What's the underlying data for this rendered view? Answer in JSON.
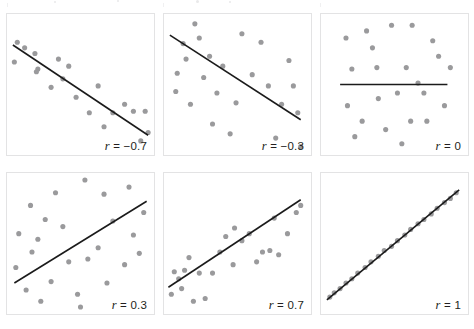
{
  "figure": {
    "width": 474,
    "height": 329,
    "background": "#ffffff",
    "dot_color": "#9a9a9c",
    "line_color": "#1b1b1b",
    "border_color": "#e3e3e4",
    "label_color": "#231f20"
  },
  "panels": [
    {
      "id": "panel-r-minus-0-7",
      "label_r": "r",
      "label_eq": " = −0.7",
      "label_full": "r = −0.7",
      "r_value": -0.7,
      "rect": {
        "x": 6,
        "y": 13,
        "w": 149,
        "h": 143
      },
      "chart_data": {
        "type": "scatter",
        "title": "r = −0.7",
        "xlabel": "",
        "ylabel": "",
        "xlim": [
          0,
          100
        ],
        "ylim": [
          0,
          100
        ],
        "grid": false,
        "legend": "none",
        "annotations": [
          "r = −0.7"
        ],
        "points": [
          [
            7,
            80
          ],
          [
            5,
            66
          ],
          [
            12,
            76
          ],
          [
            19,
            72
          ],
          [
            21,
            61
          ],
          [
            20,
            59
          ],
          [
            30,
            48
          ],
          [
            35,
            68
          ],
          [
            38,
            54
          ],
          [
            42,
            63
          ],
          [
            47,
            41
          ],
          [
            56,
            30
          ],
          [
            62,
            49
          ],
          [
            66,
            20
          ],
          [
            72,
            30
          ],
          [
            80,
            36
          ],
          [
            86,
            31
          ],
          [
            91,
            10
          ],
          [
            94,
            31
          ],
          [
            96,
            16
          ]
        ],
        "fit_line": {
          "x1": 4,
          "y1": 78,
          "x2": 96,
          "y2": 14
        }
      }
    },
    {
      "id": "panel-r-minus-0-3",
      "label_r": "r",
      "label_eq": " = −0.3",
      "label_full": "r = −0.3",
      "r_value": -0.3,
      "rect": {
        "x": 163,
        "y": 13,
        "w": 149,
        "h": 143
      },
      "chart_data": {
        "type": "scatter",
        "title": "r = −0.3",
        "xlabel": "",
        "ylabel": "",
        "xlim": [
          0,
          100
        ],
        "ylim": [
          0,
          100
        ],
        "grid": false,
        "legend": "none",
        "annotations": [
          "r = −0.3"
        ],
        "points": [
          [
            9,
            58
          ],
          [
            8,
            45
          ],
          [
            13,
            79
          ],
          [
            15,
            68
          ],
          [
            18,
            36
          ],
          [
            21,
            93
          ],
          [
            24,
            83
          ],
          [
            27,
            55
          ],
          [
            31,
            70
          ],
          [
            33,
            22
          ],
          [
            36,
            44
          ],
          [
            40,
            63
          ],
          [
            45,
            15
          ],
          [
            49,
            37
          ],
          [
            53,
            86
          ],
          [
            60,
            57
          ],
          [
            66,
            80
          ],
          [
            71,
            49
          ],
          [
            76,
            12
          ],
          [
            80,
            36
          ],
          [
            85,
            67
          ],
          [
            88,
            49
          ],
          [
            91,
            30
          ],
          [
            93,
            6
          ]
        ],
        "fit_line": {
          "x1": 4,
          "y1": 85,
          "x2": 93,
          "y2": 25
        }
      }
    },
    {
      "id": "panel-r-0",
      "label_r": "r",
      "label_eq": " = 0",
      "label_full": "r = 0",
      "r_value": 0,
      "rect": {
        "x": 320,
        "y": 13,
        "w": 149,
        "h": 143
      },
      "chart_data": {
        "type": "scatter",
        "title": "r = 0",
        "xlabel": "",
        "ylabel": "",
        "xlim": [
          0,
          100
        ],
        "ylim": [
          0,
          100
        ],
        "grid": false,
        "legend": "none",
        "annotations": [
          "r = 0"
        ],
        "points": [
          [
            17,
            83
          ],
          [
            21,
            61
          ],
          [
            18,
            35
          ],
          [
            23,
            13
          ],
          [
            28,
            24
          ],
          [
            31,
            88
          ],
          [
            35,
            76
          ],
          [
            38,
            62
          ],
          [
            39,
            40
          ],
          [
            44,
            18
          ],
          [
            48,
            92
          ],
          [
            52,
            44
          ],
          [
            55,
            8
          ],
          [
            58,
            62
          ],
          [
            61,
            24
          ],
          [
            62,
            92
          ],
          [
            66,
            51
          ],
          [
            70,
            44
          ],
          [
            72,
            24
          ],
          [
            76,
            81
          ],
          [
            80,
            70
          ],
          [
            84,
            35
          ],
          [
            88,
            62
          ]
        ],
        "fit_line": {
          "x1": 13,
          "y1": 50,
          "x2": 86,
          "y2": 50
        }
      }
    },
    {
      "id": "panel-r-0-3",
      "label_r": "r",
      "label_eq": " = 0.3",
      "label_full": "r = 0.3",
      "r_value": 0.3,
      "rect": {
        "x": 6,
        "y": 172,
        "w": 149,
        "h": 143
      },
      "chart_data": {
        "type": "scatter",
        "title": "r = 0.3",
        "xlabel": "",
        "ylabel": "",
        "xlim": [
          0,
          100
        ],
        "ylim": [
          0,
          100
        ],
        "grid": false,
        "legend": "none",
        "annotations": [
          "r = 0.3"
        ],
        "points": [
          [
            6,
            33
          ],
          [
            8,
            57
          ],
          [
            13,
            17
          ],
          [
            16,
            77
          ],
          [
            17,
            44
          ],
          [
            21,
            53
          ],
          [
            23,
            9
          ],
          [
            26,
            67
          ],
          [
            30,
            23
          ],
          [
            33,
            86
          ],
          [
            38,
            62
          ],
          [
            42,
            37
          ],
          [
            48,
            14
          ],
          [
            50,
            5
          ],
          [
            53,
            95
          ],
          [
            55,
            39
          ],
          [
            62,
            47
          ],
          [
            66,
            85
          ],
          [
            68,
            22
          ],
          [
            72,
            66
          ],
          [
            80,
            35
          ],
          [
            83,
            90
          ],
          [
            86,
            56
          ],
          [
            90,
            43
          ],
          [
            93,
            72
          ]
        ],
        "fit_line": {
          "x1": 5,
          "y1": 22,
          "x2": 95,
          "y2": 80
        }
      }
    },
    {
      "id": "panel-r-0-7",
      "label_r": "r",
      "label_eq": " = 0.7",
      "label_full": "r = 0.7",
      "r_value": 0.7,
      "rect": {
        "x": 163,
        "y": 172,
        "w": 149,
        "h": 143
      },
      "chart_data": {
        "type": "scatter",
        "title": "r = 0.7",
        "xlabel": "",
        "ylabel": "",
        "xlim": [
          0,
          100
        ],
        "ylim": [
          0,
          100
        ],
        "grid": false,
        "legend": "none",
        "annotations": [
          "r = 0.7"
        ],
        "points": [
          [
            5,
            14
          ],
          [
            7,
            30
          ],
          [
            10,
            25
          ],
          [
            12,
            18
          ],
          [
            14,
            31
          ],
          [
            17,
            40
          ],
          [
            20,
            9
          ],
          [
            24,
            29
          ],
          [
            28,
            11
          ],
          [
            33,
            29
          ],
          [
            38,
            44
          ],
          [
            42,
            55
          ],
          [
            47,
            35
          ],
          [
            48,
            61
          ],
          [
            53,
            52
          ],
          [
            58,
            57
          ],
          [
            63,
            37
          ],
          [
            67,
            44
          ],
          [
            72,
            45
          ],
          [
            75,
            68
          ],
          [
            78,
            42
          ],
          [
            84,
            57
          ],
          [
            90,
            72
          ],
          [
            93,
            77
          ]
        ],
        "fit_line": {
          "x1": 3,
          "y1": 19,
          "x2": 93,
          "y2": 81
        }
      }
    },
    {
      "id": "panel-r-1",
      "label_r": "r",
      "label_eq": " = 1",
      "label_full": "r = 1",
      "r_value": 1,
      "rect": {
        "x": 320,
        "y": 172,
        "w": 149,
        "h": 143
      },
      "chart_data": {
        "type": "scatter",
        "title": "r = 1",
        "xlabel": "",
        "ylabel": "",
        "xlim": [
          0,
          100
        ],
        "ylim": [
          0,
          100
        ],
        "grid": false,
        "legend": "none",
        "annotations": [
          "r = 1"
        ],
        "points": [
          [
            6,
            12
          ],
          [
            9,
            15
          ],
          [
            13,
            18
          ],
          [
            17,
            22
          ],
          [
            21,
            25
          ],
          [
            25,
            29
          ],
          [
            30,
            33
          ],
          [
            34,
            37
          ],
          [
            39,
            41
          ],
          [
            43,
            45
          ],
          [
            48,
            48
          ],
          [
            52,
            52
          ],
          [
            57,
            56
          ],
          [
            61,
            60
          ],
          [
            66,
            64
          ],
          [
            70,
            67
          ],
          [
            75,
            71
          ],
          [
            79,
            75
          ],
          [
            84,
            79
          ],
          [
            88,
            82
          ],
          [
            92,
            86
          ]
        ],
        "fit_line": {
          "x1": 4,
          "y1": 10,
          "x2": 94,
          "y2": 88
        }
      }
    }
  ],
  "top_artifact": {
    "dots": [
      {
        "x": 196,
        "y": 0,
        "d": 3
      },
      {
        "x": 229,
        "y": 1,
        "d": 2
      },
      {
        "x": 117,
        "y": 0,
        "d": 2
      },
      {
        "x": 54,
        "y": 1,
        "d": 2
      }
    ],
    "ticks": [
      {
        "x": 7,
        "y": 3,
        "w": 1,
        "h": 5
      },
      {
        "x": 163,
        "y": 3,
        "w": 1,
        "h": 5
      },
      {
        "x": 320,
        "y": 3,
        "w": 1,
        "h": 5
      }
    ]
  }
}
